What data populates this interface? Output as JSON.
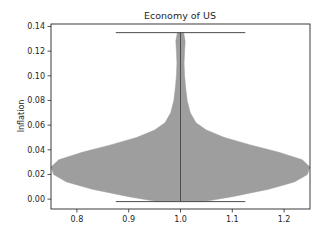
{
  "chart_data": {
    "type": "violin",
    "title": "Economy of US",
    "xlabel": "",
    "ylabel": "Inflation",
    "xlim": [
      0.75,
      1.25
    ],
    "ylim": [
      -0.008,
      0.142
    ],
    "x_ticks": [
      0.8,
      0.9,
      1.0,
      1.1,
      1.2
    ],
    "x_tick_labels": [
      "0.8",
      "0.9",
      "1.0",
      "1.1",
      "1.2"
    ],
    "y_ticks": [
      0.0,
      0.02,
      0.04,
      0.06,
      0.08,
      0.1,
      0.12,
      0.14
    ],
    "y_tick_labels": [
      "0.00",
      "0.02",
      "0.04",
      "0.06",
      "0.07",
      "0.10",
      "0.12",
      "0.14"
    ],
    "grid": false,
    "legend": null,
    "violin": {
      "position": 1.0,
      "min": -0.002,
      "max": 0.135,
      "cap_halfwidth": 0.125,
      "fill_color": "#9e9e9e",
      "line_color": "#4d4d4d",
      "density_profile": [
        {
          "y": -0.002,
          "halfwidth": 0.045
        },
        {
          "y": 0.002,
          "halfwidth": 0.1
        },
        {
          "y": 0.008,
          "halfwidth": 0.17
        },
        {
          "y": 0.014,
          "halfwidth": 0.22
        },
        {
          "y": 0.02,
          "halfwidth": 0.245
        },
        {
          "y": 0.026,
          "halfwidth": 0.25
        },
        {
          "y": 0.032,
          "halfwidth": 0.235
        },
        {
          "y": 0.038,
          "halfwidth": 0.19
        },
        {
          "y": 0.044,
          "halfwidth": 0.135
        },
        {
          "y": 0.05,
          "halfwidth": 0.085
        },
        {
          "y": 0.056,
          "halfwidth": 0.05
        },
        {
          "y": 0.062,
          "halfwidth": 0.03
        },
        {
          "y": 0.07,
          "halfwidth": 0.019
        },
        {
          "y": 0.08,
          "halfwidth": 0.013
        },
        {
          "y": 0.09,
          "halfwidth": 0.01
        },
        {
          "y": 0.1,
          "halfwidth": 0.008
        },
        {
          "y": 0.11,
          "halfwidth": 0.007
        },
        {
          "y": 0.12,
          "halfwidth": 0.008
        },
        {
          "y": 0.128,
          "halfwidth": 0.009
        },
        {
          "y": 0.135,
          "halfwidth": 0.006
        }
      ]
    }
  },
  "layout": {
    "axes": {
      "left": 51,
      "top": 24,
      "right": 310,
      "bottom": 209
    }
  }
}
